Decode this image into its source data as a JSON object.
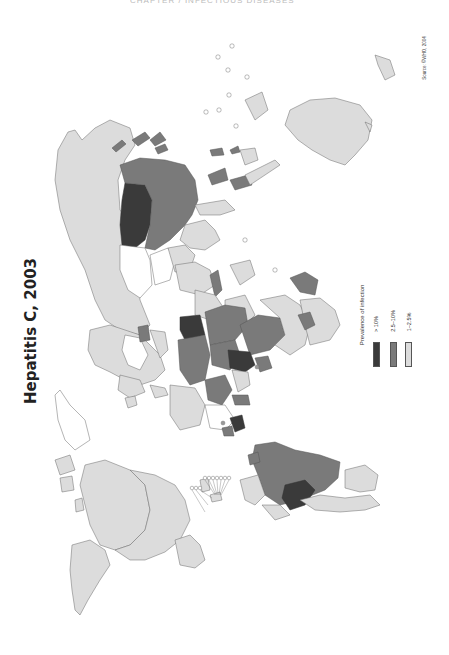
{
  "page": {
    "header": "CHAPTER / INFECTIOUS DISEASES",
    "orientation": "rotated-90-ccw"
  },
  "map": {
    "title": "Hepatitis C, 2003",
    "source": "Source: ©WHO, 2004",
    "legend": {
      "title": "Prevalence of infection",
      "items": [
        {
          "label": "> 10%",
          "color": "#3a3a3a",
          "class": "high"
        },
        {
          "label": "2.5–10%",
          "color": "#7a7a7a",
          "class": "medium"
        },
        {
          "label": "1–2.5%",
          "color": "#dcdcdc",
          "class": "low"
        }
      ]
    },
    "colors": {
      "high": "#3a3a3a",
      "medium": "#7a7a7a",
      "low": "#dcdcdc",
      "no_data": "#ffffff",
      "border": "#6a6a6a"
    },
    "regions": {
      "high": [
        "Egypt",
        "Mongolia",
        "Bolivia",
        "Cameroon",
        "Central Africa"
      ],
      "medium": [
        "China",
        "Brazil",
        "Sahel Africa",
        "Indonesia",
        "Japan",
        "Pakistan",
        "Saudi Arabia"
      ],
      "low": [
        "North America",
        "Russia",
        "Europe",
        "Australia",
        "Southern Africa",
        "Argentina"
      ]
    }
  }
}
